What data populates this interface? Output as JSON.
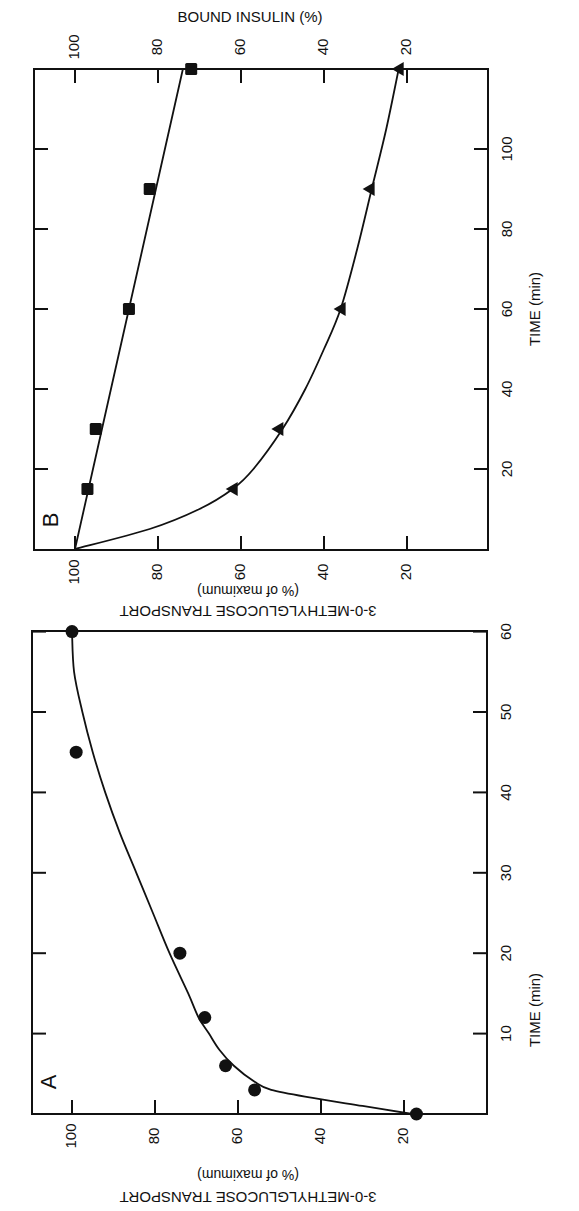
{
  "chart_data": [
    {
      "type": "scatter",
      "panel": "A",
      "title": "",
      "panel_label": "A",
      "xlabel": "TIME (min)",
      "ylabel": "3-0-METHYLGLUCOSE TRANSPORT",
      "ylabel_sub": "(% of maximum)",
      "xlim": [
        0,
        60
      ],
      "ylim": [
        10,
        110
      ],
      "x_ticks": [
        10,
        20,
        30,
        40,
        50,
        60
      ],
      "y_ticks": [
        20,
        40,
        60,
        80,
        100
      ],
      "grid": false,
      "orientation": "figure rotated 90 degrees clockwise on page",
      "series": [
        {
          "name": "3-O-methylglucose transport",
          "marker": "circle",
          "x": [
            0,
            3,
            6,
            12,
            20,
            45,
            60
          ],
          "y": [
            17,
            56,
            63,
            68,
            74,
            99,
            100
          ],
          "fit_curve": {
            "x": [
              0,
              1,
              2,
              3,
              4,
              6,
              8,
              10,
              12,
              15,
              20,
              25,
              30,
              35,
              40,
              45,
              50,
              55,
              60
            ],
            "y": [
              18,
              30,
              42,
              52,
              56,
              61,
              64.5,
              67,
              69.5,
              72,
              76.5,
              80.5,
              84.5,
              88.5,
              92,
              95,
              97.5,
              99.5,
              100
            ]
          }
        }
      ]
    },
    {
      "type": "scatter",
      "panel": "B",
      "title": "",
      "panel_label": "B",
      "xlabel": "TIME (min)",
      "ylabel": "3-0-METHYLGLUCOSE TRANSPORT",
      "ylabel_sub": "(% of maximum)",
      "y2label": "BOUND INSULIN (%)",
      "xlim": [
        0,
        120
      ],
      "ylim": [
        10,
        110
      ],
      "x_ticks": [
        20,
        40,
        60,
        80,
        100
      ],
      "y_ticks": [
        20,
        40,
        60,
        80,
        100
      ],
      "y2_ticks": [
        20,
        40,
        60,
        80,
        100
      ],
      "grid": false,
      "orientation": "figure rotated 90 degrees clockwise on page",
      "series": [
        {
          "name": "Bound insulin",
          "marker": "square",
          "axis": "y2",
          "x": [
            15,
            30,
            60,
            90,
            120
          ],
          "y": [
            97,
            95,
            87,
            82,
            72
          ],
          "fit_curve": {
            "x": [
              0,
              30,
              60,
              90,
              120
            ],
            "y": [
              100,
              93.5,
              87,
              80.5,
              74
            ]
          }
        },
        {
          "name": "3-O-methylglucose transport",
          "marker": "triangle",
          "axis": "y",
          "x": [
            15,
            30,
            60,
            90,
            120
          ],
          "y": [
            62,
            51,
            36,
            29,
            22
          ],
          "fit_curve": {
            "x": [
              0,
              5,
              10,
              15,
              20,
              30,
              40,
              50,
              60,
              75,
              90,
              105,
              120
            ],
            "y": [
              100,
              82,
              70,
              62,
              57,
              50,
              44.5,
              40,
              36,
              32,
              28.5,
              25,
              22
            ]
          }
        }
      ]
    }
  ],
  "labels": {
    "panel_a": "A",
    "panel_b": "B",
    "time_axis": "TIME (min)",
    "transport_title": "3-0-METHYLGLUCOSE TRANSPORT",
    "transport_sub": "(% of maximum)",
    "bound_insulin": "BOUND INSULIN (%)"
  }
}
